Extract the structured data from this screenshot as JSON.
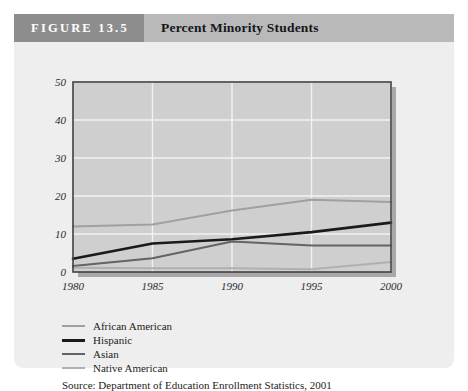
{
  "figure": {
    "number_label": "FIGURE 13.5",
    "title": "Percent Minority Students",
    "source": "Source: Department of Education Enrollment Statistics, 2001"
  },
  "colors": {
    "page_background": "#ffffff",
    "card_background": "#eeeeee",
    "header_band": "#b9b9b9",
    "header_number_box": "#8d8d8d",
    "header_number_text": "#ffffff",
    "plot_background": "#cfcfcf",
    "gridline": "#f2f2f2",
    "axis_line": "#404046",
    "plot_shadow": "#a8a8a8",
    "series_african_american": "#a0a0a0",
    "series_hispanic": "#1a1a1e",
    "series_asian": "#636368",
    "series_native_american": "#b0b0b0",
    "text": "#1c1d21"
  },
  "chart_data": {
    "type": "line",
    "title": "Percent Minority Students",
    "xlabel": "",
    "ylabel": "",
    "x": [
      1980,
      1985,
      1990,
      1995,
      2000
    ],
    "xtick_labels": [
      "1980",
      "1985",
      "1990",
      "1995",
      "2000"
    ],
    "ytick_labels": [
      "0",
      "10",
      "20",
      "30",
      "40",
      "50"
    ],
    "yticks": [
      0,
      10,
      20,
      30,
      40,
      50
    ],
    "xlim": [
      1980,
      2000
    ],
    "ylim": [
      0,
      50
    ],
    "grid": true,
    "legend_position": "below-left",
    "series": [
      {
        "name": "African American",
        "color": "#a0a0a0",
        "width": 2.0,
        "values": [
          12.0,
          12.5,
          16.2,
          19.0,
          18.4
        ]
      },
      {
        "name": "Hispanic",
        "color": "#1a1a1e",
        "width": 2.6,
        "values": [
          3.5,
          7.5,
          8.6,
          10.5,
          13.0
        ]
      },
      {
        "name": "Asian",
        "color": "#636368",
        "width": 2.0,
        "values": [
          1.6,
          3.6,
          8.0,
          7.0,
          7.0
        ]
      },
      {
        "name": "Native American",
        "color": "#b0b0b0",
        "width": 2.0,
        "values": [
          1.1,
          1.0,
          1.0,
          0.7,
          2.6
        ]
      }
    ]
  }
}
